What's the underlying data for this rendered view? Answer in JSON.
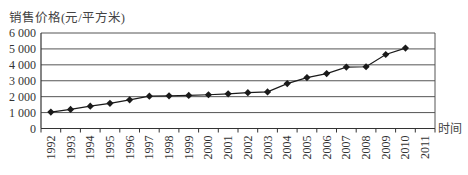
{
  "chart_data": {
    "type": "line",
    "title": "",
    "ylabel": "销售价格(元/平方米)",
    "xlabel": "时间",
    "categories": [
      "1992",
      "1993",
      "1994",
      "1995",
      "1996",
      "1997",
      "1998",
      "1999",
      "2000",
      "2001",
      "2002",
      "2003",
      "2004",
      "2005",
      "2006",
      "2007",
      "2008",
      "2009",
      "2010",
      "2011"
    ],
    "series": [
      {
        "name": "销售价格",
        "values": [
          1030,
          1200,
          1400,
          1580,
          1800,
          2030,
          2050,
          2080,
          2120,
          2180,
          2250,
          2300,
          2820,
          3200,
          3450,
          3860,
          3880,
          4650,
          5050,
          null
        ],
        "marker": "diamond",
        "color": "#1a1a1a"
      }
    ],
    "yticks": [
      0,
      1000,
      2000,
      3000,
      4000,
      5000,
      6000
    ],
    "ytick_labels": [
      "0",
      "1 000",
      "2 000",
      "3 000",
      "4 000",
      "5 000",
      "6 000"
    ],
    "ylim": [
      0,
      6000
    ],
    "grid": true,
    "legend": false
  }
}
